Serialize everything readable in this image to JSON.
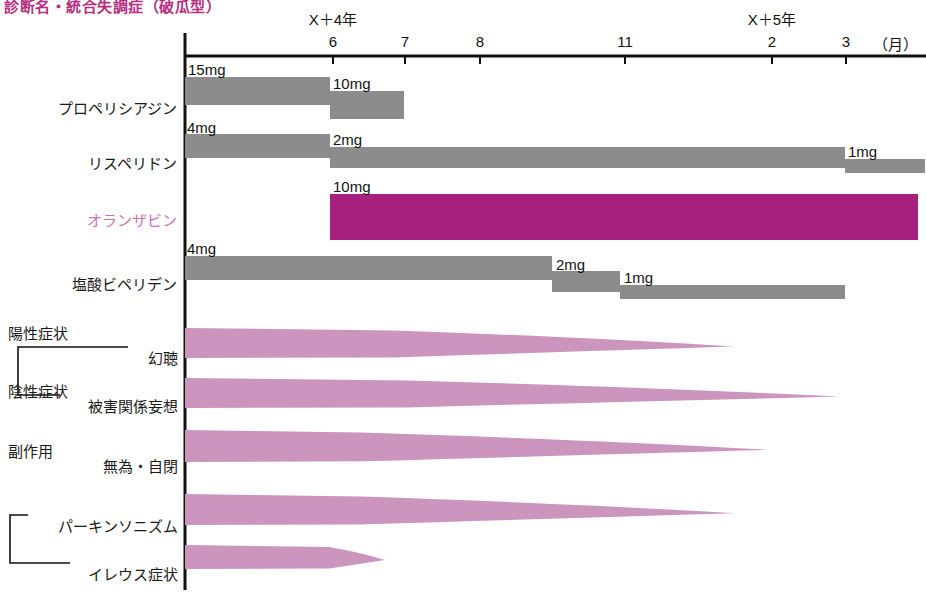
{
  "title": "診断名・統合失調症（破瓜型）",
  "axis": {
    "unit_label": "（月）",
    "year_labels": [
      {
        "text": "X＋4年",
        "x": 333
      },
      {
        "text": "X＋5年",
        "x": 772
      }
    ],
    "month_ticks": [
      {
        "label": "6",
        "x": 333
      },
      {
        "label": "7",
        "x": 405
      },
      {
        "label": "8",
        "x": 480
      },
      {
        "label": "11",
        "x": 625
      },
      {
        "label": "2",
        "x": 772
      },
      {
        "label": "3",
        "x": 846
      }
    ],
    "origin_x": 185,
    "end_x": 920
  },
  "colors": {
    "accent_magenta": "#A8207E",
    "accent_pink": "#CC95BE",
    "drug_gray": "#8C8C8C",
    "title_pink": "#B5307F",
    "label_pink": "#CC73AD",
    "axis_black": "#111111"
  },
  "drug_rows": [
    {
      "name": "プロペリシアジン",
      "accent": false,
      "label_y": 97,
      "segments": [
        {
          "dose": "15mg",
          "x0": 185,
          "x1": 330,
          "top": 77,
          "height": 28,
          "dose_x": 188,
          "dose_y": 61
        },
        {
          "dose": "10mg",
          "x0": 330,
          "x1": 404,
          "top": 91,
          "height": 28,
          "dose_x": 333,
          "dose_y": 75
        }
      ]
    },
    {
      "name": "リスペリドン",
      "accent": false,
      "label_y": 152,
      "segments": [
        {
          "dose": "4mg",
          "x0": 185,
          "x1": 330,
          "top": 134,
          "height": 24,
          "dose_x": 187,
          "dose_y": 119
        },
        {
          "dose": "2mg",
          "x0": 330,
          "x1": 845,
          "top": 147,
          "height": 21,
          "dose_x": 333,
          "dose_y": 131
        },
        {
          "dose": "1mg",
          "x0": 845,
          "x1": 925,
          "top": 159,
          "height": 14,
          "dose_x": 848,
          "dose_y": 143
        }
      ]
    },
    {
      "name": "オランザビン",
      "accent": true,
      "label_y": 209,
      "segments": [
        {
          "dose": "10mg",
          "x0": 330,
          "x1": 918,
          "top": 194,
          "height": 46,
          "dose_x": 333,
          "dose_y": 178
        }
      ]
    },
    {
      "name": "塩酸ビペリデン",
      "accent": false,
      "label_y": 273,
      "segments": [
        {
          "dose": "4mg",
          "x0": 185,
          "x1": 552,
          "top": 256,
          "height": 24,
          "dose_x": 187,
          "dose_y": 240
        },
        {
          "dose": "2mg",
          "x0": 552,
          "x1": 620,
          "top": 271,
          "height": 21,
          "dose_x": 556,
          "dose_y": 256
        },
        {
          "dose": "1mg",
          "x0": 620,
          "x1": 845,
          "top": 285,
          "height": 14,
          "dose_x": 624,
          "dose_y": 269
        }
      ]
    }
  ],
  "symptom_groups": [
    {
      "group": "陽性症状",
      "group_x": 8,
      "group_y": 322,
      "bracket": {
        "x": 18,
        "y_top": 347,
        "y_bottom": 395,
        "arm_top": 110,
        "arm_bottom": 42
      },
      "items": [
        {
          "label": "幻聴",
          "label_x": 178,
          "label_y": 347,
          "band": {
            "x0": 185,
            "x1": 735,
            "top": 328,
            "thick": 30,
            "taper_from": 0.38
          }
        },
        {
          "label": "被害関係妄想",
          "label_x": 178,
          "label_y": 395,
          "band": {
            "x0": 185,
            "x1": 840,
            "top": 378,
            "thick": 30,
            "taper_from": 0.34
          }
        }
      ]
    },
    {
      "group": "陰性症状",
      "group_x": 8,
      "group_y": 380,
      "bracket": null,
      "items": [
        {
          "label": "無為・自閉",
          "label_x": 178,
          "label_y": 455,
          "band": {
            "x0": 185,
            "x1": 770,
            "top": 430,
            "thick": 32,
            "taper_from": 0.3
          }
        }
      ]
    },
    {
      "group": "副作用",
      "group_x": 8,
      "group_y": 440,
      "bracket": {
        "x": 10,
        "y_top": 515,
        "y_bottom": 563,
        "arm_top": 18,
        "arm_bottom": 60
      },
      "items": [
        {
          "label": "パーキンソニズム",
          "label_x": 178,
          "label_y": 515,
          "band": {
            "x0": 185,
            "x1": 735,
            "top": 494,
            "thick": 31,
            "taper_from": 0.32
          }
        },
        {
          "label": "イレウス症状",
          "label_x": 178,
          "label_y": 563,
          "band": {
            "x0": 185,
            "x1": 385,
            "top": 545,
            "thick": 24,
            "taper_from": 0.72
          }
        }
      ]
    }
  ],
  "chart_data": {
    "type": "bar",
    "title": "診断名・統合失調症（破瓜型）",
    "xlabel": "（月）",
    "ylabel": "",
    "grid": false,
    "legend_position": "none",
    "x_axis": {
      "type": "time",
      "tick_labels": [
        "6",
        "7",
        "8",
        "11",
        "2",
        "3"
      ],
      "year_groups": [
        {
          "label": "X＋4年",
          "months": [
            "6",
            "7",
            "8",
            "11"
          ]
        },
        {
          "label": "X＋5年",
          "months": [
            "2",
            "3"
          ]
        }
      ],
      "range_start": "X+4年 before 6月",
      "range_end": "X+5年 after 3月"
    },
    "series": [
      {
        "name": "プロペリシアジン",
        "kind": "medication-dose-timeline",
        "unit": "mg",
        "color": "#8C8C8C",
        "steps": [
          {
            "dose": 15,
            "dose_label": "15mg",
            "start": "X+4年 pre-6月",
            "end": "X+4年 6月"
          },
          {
            "dose": 10,
            "dose_label": "10mg",
            "start": "X+4年 6月",
            "end": "X+4年 7月"
          }
        ]
      },
      {
        "name": "リスペリドン",
        "kind": "medication-dose-timeline",
        "unit": "mg",
        "color": "#8C8C8C",
        "steps": [
          {
            "dose": 4,
            "dose_label": "4mg",
            "start": "X+4年 pre-6月",
            "end": "X+4年 6月"
          },
          {
            "dose": 2,
            "dose_label": "2mg",
            "start": "X+4年 6月",
            "end": "X+5年 3月"
          },
          {
            "dose": 1,
            "dose_label": "1mg",
            "start": "X+5年 3月",
            "end": "X+5年 post-3月"
          }
        ]
      },
      {
        "name": "オランザビン",
        "kind": "medication-dose-timeline",
        "unit": "mg",
        "color": "#A8207E",
        "highlight": true,
        "steps": [
          {
            "dose": 10,
            "dose_label": "10mg",
            "start": "X+4年 6月",
            "end": "X+5年 post-3月"
          }
        ]
      },
      {
        "name": "塩酸ビペリデン",
        "kind": "medication-dose-timeline",
        "unit": "mg",
        "color": "#8C8C8C",
        "steps": [
          {
            "dose": 4,
            "dose_label": "4mg",
            "start": "X+4年 pre-6月",
            "end": "X+4年 ~10月"
          },
          {
            "dose": 2,
            "dose_label": "2mg",
            "start": "X+4年 ~10月",
            "end": "X+4年 11月"
          },
          {
            "dose": 1,
            "dose_label": "1mg",
            "start": "X+4年 11月",
            "end": "X+5年 3月"
          }
        ]
      },
      {
        "name": "幻聴",
        "kind": "symptom-severity-wedge",
        "group": "陽性症状",
        "color": "#CC95BE",
        "severity_start": 1.0,
        "severity_end": 0.0,
        "end": "X+4年 ~12月"
      },
      {
        "name": "被害関係妄想",
        "kind": "symptom-severity-wedge",
        "group": "陽性症状",
        "color": "#CC95BE",
        "severity_start": 1.0,
        "severity_end": 0.0,
        "end": "X+5年 ~3月"
      },
      {
        "name": "無為・自閉",
        "kind": "symptom-severity-wedge",
        "group": "陰性症状",
        "color": "#CC95BE",
        "severity_start": 1.0,
        "severity_end": 0.0,
        "end": "X+5年 ~2月"
      },
      {
        "name": "パーキンソニズム",
        "kind": "symptom-severity-wedge",
        "group": "副作用",
        "color": "#CC95BE",
        "severity_start": 1.0,
        "severity_end": 0.0,
        "end": "X+4年 ~12月"
      },
      {
        "name": "イレウス症状",
        "kind": "symptom-severity-wedge",
        "group": "副作用",
        "color": "#CC95BE",
        "severity_start": 1.0,
        "severity_end": 0.0,
        "end": "X+4年 ~6.7月"
      }
    ]
  }
}
